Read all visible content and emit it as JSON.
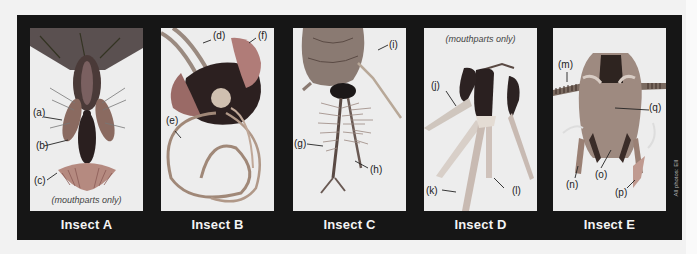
{
  "figure": {
    "background_color": "#161616",
    "credit": "All photos: EII",
    "panels": [
      {
        "id": "A",
        "caption": "Insect A",
        "note": "(mouthparts only)",
        "labels": [
          "(a)",
          "(b)",
          "(c)"
        ]
      },
      {
        "id": "B",
        "caption": "Insect B",
        "note": "",
        "labels": [
          "(d)",
          "(e)",
          "(f)"
        ]
      },
      {
        "id": "C",
        "caption": "Insect C",
        "note": "",
        "labels": [
          "(g)",
          "(h)",
          "(i)"
        ]
      },
      {
        "id": "D",
        "caption": "Insect D",
        "note": "(mouthparts only)",
        "labels": [
          "(j)",
          "(k)",
          "(l)"
        ]
      },
      {
        "id": "E",
        "caption": "Insect E",
        "note": "",
        "labels": [
          "(m)",
          "(n)",
          "(o)",
          "(p)",
          "(q)"
        ]
      }
    ]
  }
}
